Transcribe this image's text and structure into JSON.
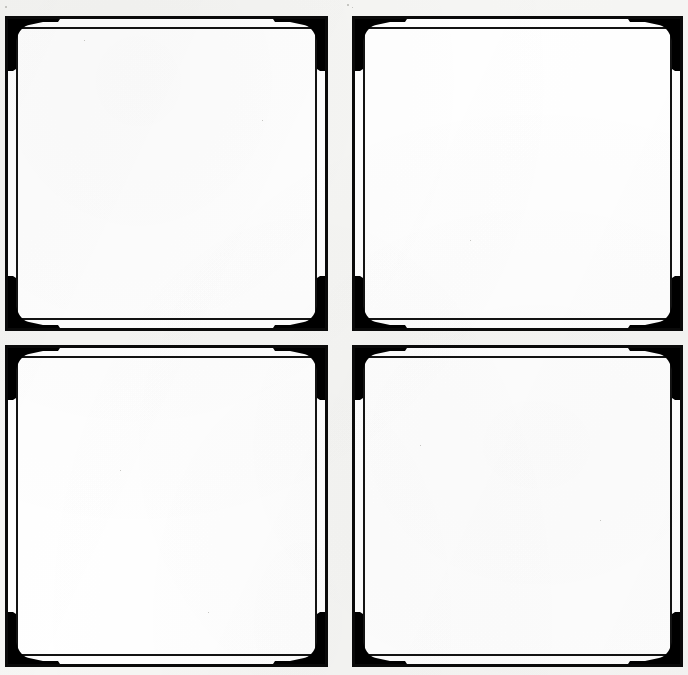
{
  "document": {
    "title": "Ornamental Blank Frames Sheet",
    "description": "Scanned sheet showing four identical empty decorative rectangular frames arranged in a two by two grid",
    "background_color": "#f6f6f4",
    "paper_color": "#fdfdfc",
    "ink_color": "#000000",
    "panel_count": 4,
    "grid": {
      "rows": 2,
      "columns": 2
    }
  },
  "frame_style": {
    "name": "double-rule-with-corner-ornaments",
    "outer_rule_weight_px": 3,
    "inner_rule_weight_px": 2,
    "rule_gap_px": 9,
    "corner_ornament": "solid-black-triangle-with-stepped-notch",
    "ornament_count_per_frame": 4,
    "ornament_size_px": 48,
    "interior_fill": "#ffffff",
    "interior_content": ""
  },
  "panels": [
    {
      "id": "panel-top-left",
      "label": "Top Left Frame",
      "position": {
        "x": 5,
        "y": 16,
        "width": 323,
        "height": 315
      },
      "content": ""
    },
    {
      "id": "panel-top-right",
      "label": "Top Right Frame",
      "position": {
        "x": 352,
        "y": 16,
        "width": 331,
        "height": 315
      },
      "content": ""
    },
    {
      "id": "panel-bottom-left",
      "label": "Bottom Left Frame",
      "position": {
        "x": 5,
        "y": 345,
        "width": 323,
        "height": 322
      },
      "content": ""
    },
    {
      "id": "panel-bottom-right",
      "label": "Bottom Right Frame",
      "position": {
        "x": 352,
        "y": 345,
        "width": 331,
        "height": 322
      },
      "content": ""
    }
  ],
  "corners": [
    {
      "name": "top-left-ornament",
      "rotation": 0
    },
    {
      "name": "top-right-ornament",
      "rotation": 90
    },
    {
      "name": "bottom-right-ornament",
      "rotation": 180
    },
    {
      "name": "bottom-left-ornament",
      "rotation": 270
    }
  ],
  "artifacts": {
    "note": "scan speckles and faint paper mottling visible on the background"
  }
}
